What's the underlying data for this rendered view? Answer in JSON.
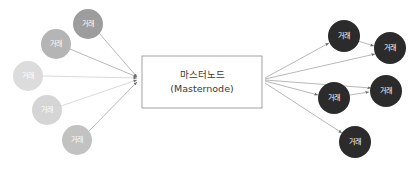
{
  "diagram": {
    "type": "node-network",
    "title_visible": false,
    "background_color": "#ffffff",
    "master": {
      "label_korean": "마스터노드",
      "label_english": "(Masternode)",
      "shape": "rectangle",
      "x": 142,
      "y": 56,
      "width": 120,
      "height": 52,
      "fill": "#ffffff",
      "stroke": "#8a8a8a"
    },
    "left_nodes": [
      {
        "label": "거래",
        "cx": 88,
        "cy": 24,
        "r": 15,
        "fill": "#9d9d9d",
        "text_fill": "#ffffff"
      },
      {
        "label": "거래",
        "cx": 56,
        "cy": 44,
        "r": 15,
        "fill": "#b5b5b5",
        "text_fill": "#ffffff"
      },
      {
        "label": "거래",
        "cx": 28,
        "cy": 76,
        "r": 15,
        "fill": "#dcdcdc",
        "text_fill": "#ffffff"
      },
      {
        "label": "거래",
        "cx": 47,
        "cy": 110,
        "r": 15,
        "fill": "#d5d5d5",
        "text_fill": "#ffffff"
      },
      {
        "label": "거래",
        "cx": 77,
        "cy": 140,
        "r": 15,
        "fill": "#c2c2c2",
        "text_fill": "#ffffff"
      }
    ],
    "right_nodes": [
      {
        "label": "거래",
        "cx": 344,
        "cy": 36,
        "r": 16,
        "fill": "#2b2b2b",
        "text_fill": "#ffffff"
      },
      {
        "label": "거래",
        "cx": 390,
        "cy": 48,
        "r": 16,
        "fill": "#2b2b2b",
        "text_fill": "#ffffff"
      },
      {
        "label": "거래",
        "cx": 334,
        "cy": 98,
        "r": 16,
        "fill": "#2b2b2b",
        "text_fill": "#ffffff"
      },
      {
        "label": "거래",
        "cx": 386,
        "cy": 91,
        "r": 16,
        "fill": "#2b2b2b",
        "text_fill": "#ffffff"
      },
      {
        "label": "거래",
        "cx": 355,
        "cy": 142,
        "r": 16,
        "fill": "#2b2b2b",
        "text_fill": "#ffffff"
      }
    ],
    "convergence_point": {
      "x": 140,
      "y": 79
    },
    "divergence_point": {
      "x": 263,
      "y": 80
    },
    "edge_color": "#9a9a9a",
    "edge_color_light": "#c9c9c9",
    "arrow_color": "#6e6e6e",
    "edges": {
      "inbound_count": 5,
      "outbound_count": 5,
      "chained_count": 2,
      "direction_inbound": "left-nodes -> masternode",
      "direction_outbound": "masternode -> right-nodes"
    }
  }
}
